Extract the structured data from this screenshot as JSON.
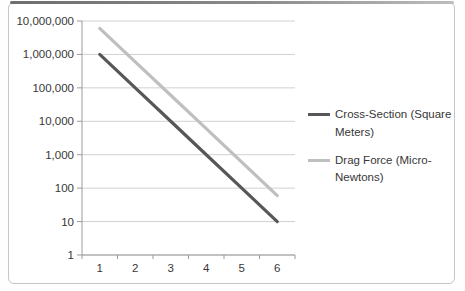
{
  "chart_data": {
    "type": "line",
    "title": "",
    "xlabel": "",
    "ylabel": "",
    "x_categories": [
      "1",
      "2",
      "3",
      "4",
      "5",
      "6"
    ],
    "y_axis": {
      "scale": "log",
      "min": 1,
      "max": 10000000,
      "tick_values": [
        10000000,
        1000000,
        100000,
        10000,
        1000,
        100,
        10,
        1
      ],
      "tick_labels": [
        "10,000,000",
        "1,000,000",
        "100,000",
        "10,000",
        "1,000",
        "100",
        "10",
        "1"
      ]
    },
    "series": [
      {
        "name": "Cross-Section (Square Meters)",
        "color": "#575757",
        "values": [
          1000000,
          100000,
          10000,
          1000,
          100,
          10
        ]
      },
      {
        "name": "Drag Force (Micro-Newtons)",
        "color": "#bfbfbf",
        "values": [
          6000000,
          600000,
          60000,
          6000,
          600,
          60
        ]
      }
    ],
    "legend_position": "right",
    "grid": "horizontal",
    "gridline_color": "#d1d1d1",
    "axis_color": "#9b9b9b",
    "text_color": "#373737"
  }
}
